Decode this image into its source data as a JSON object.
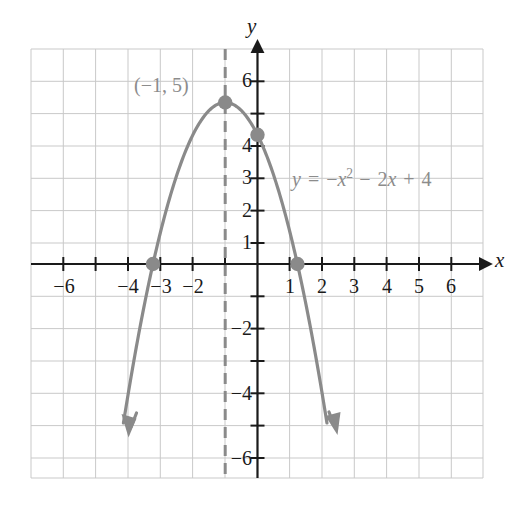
{
  "figure": {
    "background_color": "#ffffff",
    "curve_color": "#8a8a8a",
    "axis_color": "#1a1a1a",
    "grid_color": "#c8c8c8",
    "label_color": "#8c8c8c"
  },
  "axes": {
    "x_axis_name": "x",
    "y_axis_name": "y",
    "x_ticks_negative": [
      "−6",
      "−4",
      "−3",
      "−2"
    ],
    "x_ticks_positive": [
      "1",
      "2",
      "3",
      "4",
      "5",
      "6"
    ],
    "y_ticks_positive": [
      "6",
      "4",
      "3",
      "2",
      "1"
    ],
    "y_ticks_negative": [
      "−2",
      "−4",
      "−6"
    ]
  },
  "annotations": {
    "vertex_label": "(−1, 5)",
    "equation_prefix": "y",
    "equation_equals": "=",
    "equation_term1_sign": "−",
    "equation_term1_var": "x",
    "equation_term1_exp": "2",
    "equation_term2_sign": "−",
    "equation_term2_coef": "2",
    "equation_term2_var": "x",
    "equation_term3_sign": "+",
    "equation_term3_const": "4",
    "equation_full": "y = −x² − 2x + 4"
  },
  "chart_data": {
    "type": "line",
    "title": "",
    "xlabel": "x",
    "ylabel": "y",
    "xlim": [
      -7,
      7
    ],
    "ylim": [
      -7,
      7
    ],
    "grid": true,
    "legend": "none",
    "function": "y = -x^2 - 2x + 4",
    "coefficients": {
      "a": -1,
      "b": -2,
      "c": 4
    },
    "vertex": {
      "x": -1,
      "y": 5,
      "label": "(−1, 5)"
    },
    "axis_of_symmetry": {
      "x": -1,
      "style": "dashed"
    },
    "y_intercept": {
      "x": 0,
      "y": 4
    },
    "x_intercepts": [
      {
        "x": -3.236,
        "y": 0
      },
      {
        "x": 1.236,
        "y": 0
      }
    ],
    "marked_points": [
      {
        "x": -3.236,
        "y": 0
      },
      {
        "x": -1,
        "y": 5
      },
      {
        "x": 0,
        "y": 4
      },
      {
        "x": 1.236,
        "y": 0
      }
    ],
    "x_tick_values": [
      -6,
      -4,
      -3,
      -2,
      1,
      2,
      3,
      4,
      5,
      6
    ],
    "y_tick_values": [
      6,
      4,
      3,
      2,
      1,
      -2,
      -4,
      -6
    ],
    "series": [
      {
        "name": "y = -x^2 - 2x + 4",
        "x": [
          -4.15,
          -4.0,
          -3.5,
          -3.0,
          -2.5,
          -2.0,
          -1.5,
          -1.0,
          -0.5,
          0.0,
          0.5,
          1.0,
          1.5,
          2.0,
          2.15
        ],
        "values": [
          -4.93,
          -4.0,
          -1.25,
          1.0,
          2.75,
          4.0,
          4.75,
          5.0,
          4.75,
          4.0,
          2.75,
          1.0,
          -1.25,
          -4.0,
          -4.92
        ]
      }
    ],
    "arrow_ends": [
      {
        "x": -4.15,
        "y": -4.93,
        "direction": "down-left"
      },
      {
        "x": 2.15,
        "y": -4.92,
        "direction": "down-right"
      }
    ]
  }
}
